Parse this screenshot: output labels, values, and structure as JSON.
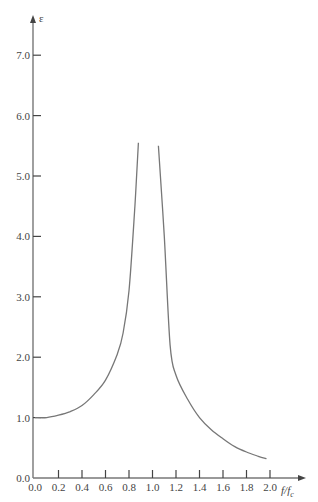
{
  "chart_data": {
    "type": "line",
    "title": "",
    "xlabel": "f/f_c",
    "ylabel": "ε",
    "xlim": [
      0.0,
      2.0
    ],
    "ylim": [
      0.0,
      7.0
    ],
    "grid": false,
    "legend": null,
    "x_ticks": [
      "0.0",
      "0.2",
      "0.4",
      "0.6",
      "0.8",
      "1.0",
      "1.2",
      "1.4",
      "1.6",
      "1.8",
      "2.0"
    ],
    "y_ticks": [
      "0.0",
      "1.0",
      "2.0",
      "3.0",
      "4.0",
      "5.0",
      "6.0",
      "7.0"
    ],
    "series": [
      {
        "name": "below resonance",
        "x": [
          0.0,
          0.1,
          0.2,
          0.3,
          0.4,
          0.5,
          0.6,
          0.7,
          0.75,
          0.8,
          0.85,
          0.88
        ],
        "values": [
          1.0,
          1.0,
          1.04,
          1.1,
          1.2,
          1.38,
          1.62,
          2.05,
          2.4,
          3.1,
          4.5,
          5.55
        ]
      },
      {
        "name": "above resonance",
        "x": [
          1.05,
          1.1,
          1.15,
          1.2,
          1.3,
          1.4,
          1.5,
          1.6,
          1.7,
          1.8,
          1.9,
          1.97
        ],
        "values": [
          5.5,
          4.0,
          2.2,
          1.7,
          1.3,
          1.0,
          0.8,
          0.65,
          0.52,
          0.43,
          0.36,
          0.32
        ]
      }
    ]
  },
  "labels": {
    "y_axis_symbol": "ε",
    "x_axis_main": "f",
    "x_axis_sep": "/",
    "x_axis_f": "f",
    "x_axis_sub": "c"
  },
  "colors": {
    "axis": "#777777",
    "curve": "#777777",
    "text": "#444444"
  }
}
